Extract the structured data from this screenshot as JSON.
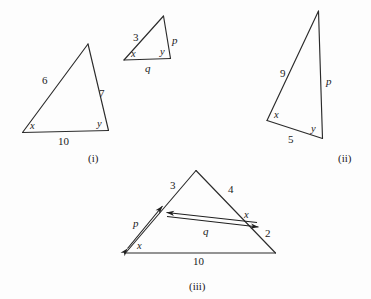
{
  "figure": {
    "background_color": "#fdfdfd",
    "line_color": "#2b2b2b",
    "text_color": "#1b1b1b"
  },
  "panels": [
    {
      "id": "i",
      "caption": "(i)",
      "side_labels": [
        {
          "text": "6",
          "kind": "number"
        },
        {
          "text": "7",
          "kind": "number"
        },
        {
          "text": "10",
          "kind": "number"
        }
      ],
      "angle_labels": [
        {
          "text": "x",
          "kind": "variable"
        },
        {
          "text": "y",
          "kind": "variable"
        }
      ]
    },
    {
      "id": "small",
      "caption": "",
      "side_labels": [
        {
          "text": "3",
          "kind": "number"
        },
        {
          "text": "p",
          "kind": "variable"
        },
        {
          "text": "q",
          "kind": "variable"
        }
      ],
      "angle_labels": [
        {
          "text": "x",
          "kind": "variable"
        },
        {
          "text": "y",
          "kind": "variable"
        }
      ]
    },
    {
      "id": "ii",
      "caption": "(ii)",
      "side_labels": [
        {
          "text": "9",
          "kind": "number"
        },
        {
          "text": "p",
          "kind": "variable"
        },
        {
          "text": "5",
          "kind": "number"
        }
      ],
      "angle_labels": [
        {
          "text": "x",
          "kind": "variable"
        },
        {
          "text": "y",
          "kind": "variable"
        }
      ]
    },
    {
      "id": "iii",
      "caption": "(iii)",
      "side_labels": [
        {
          "text": "3",
          "kind": "number"
        },
        {
          "text": "4",
          "kind": "number"
        },
        {
          "text": "2",
          "kind": "number"
        },
        {
          "text": "10",
          "kind": "number"
        },
        {
          "text": "p",
          "kind": "variable"
        },
        {
          "text": "q",
          "kind": "variable"
        }
      ],
      "angle_labels": [
        {
          "text": "x",
          "kind": "variable"
        },
        {
          "text": "x",
          "kind": "variable"
        }
      ]
    }
  ],
  "labels": {
    "t1_side_left": "6",
    "t1_side_right": "7",
    "t1_base": "10",
    "t1_angle_left": "x",
    "t1_angle_right": "y",
    "t2_side_left": "3",
    "t2_side_right": "p",
    "t2_base": "q",
    "t2_angle_left": "x",
    "t2_angle_right": "y",
    "t3_side_left": "9",
    "t3_side_right": "p",
    "t3_base": "5",
    "t3_angle_left": "x",
    "t3_angle_right": "y",
    "t4_side_upper_left": "3",
    "t4_side_upper_right": "4",
    "t4_side_lower_right": "2",
    "t4_base": "10",
    "t4_arrow_left": "p",
    "t4_arrow_inner": "q",
    "t4_angle_left": "x",
    "t4_angle_inner": "x",
    "caption_i": "(i)",
    "caption_ii": "(ii)",
    "caption_iii": "(iii)"
  }
}
